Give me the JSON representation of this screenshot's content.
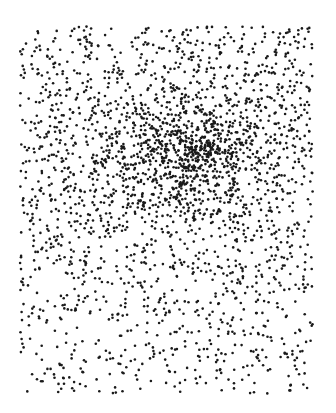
{
  "image": {
    "description": "Stippled dot-density illustration with a dense dark cluster in the upper-center",
    "width": 336,
    "height": 413,
    "background": "#ffffff",
    "dot_color": "#1a1a1a",
    "dot_radius": 1.3,
    "region": {
      "x0": 20,
      "y0": 26,
      "x1": 313,
      "y1": 394
    },
    "gap": {
      "x0": 272,
      "y0": 362,
      "x1": 287,
      "y1": 394
    },
    "background_density": {
      "count": 1700,
      "bias_top": 0.55
    },
    "clusters": [
      {
        "cx": 185,
        "cy": 148,
        "sx": 55,
        "sy": 32,
        "count": 520
      },
      {
        "cx": 200,
        "cy": 150,
        "sx": 18,
        "sy": 10,
        "count": 120
      },
      {
        "cx": 150,
        "cy": 168,
        "sx": 70,
        "sy": 45,
        "count": 300
      }
    ],
    "seed": 20240613
  }
}
